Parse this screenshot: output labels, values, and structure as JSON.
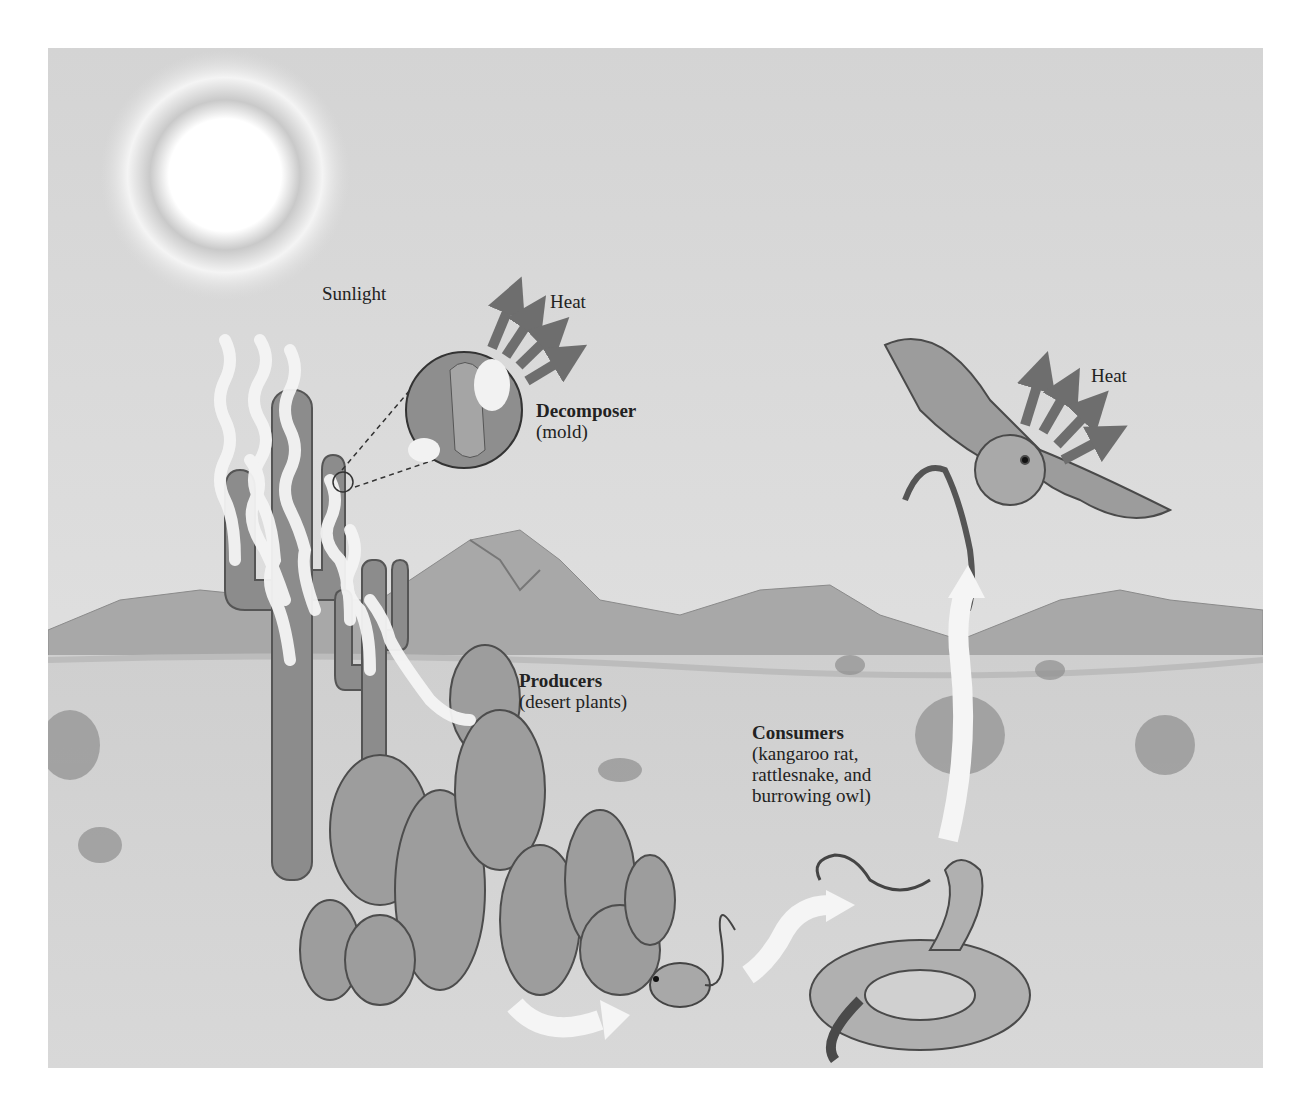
{
  "diagram": {
    "frame": {
      "x": 48,
      "y": 48,
      "width": 1215,
      "height": 1020,
      "background": "#d9d9d9"
    },
    "labels": {
      "sunlight": "Sunlight",
      "heat_decomposer": "Heat",
      "heat_owl": "Heat",
      "decomposer_title": "Decomposer",
      "decomposer_sub": "(mold)",
      "producers_title": "Producers",
      "producers_sub": "(desert plants)",
      "consumers_title": "Consumers",
      "consumers_sub_1": "(kangaroo rat,",
      "consumers_sub_2": "rattlesnake, and",
      "consumers_sub_3": "burrowing owl)"
    },
    "nodes": [
      {
        "id": "sun",
        "label": "Sunlight",
        "type": "energy-source"
      },
      {
        "id": "producers",
        "label": "Producers (desert plants)",
        "type": "producer"
      },
      {
        "id": "decomposer",
        "label": "Decomposer (mold)",
        "type": "decomposer"
      },
      {
        "id": "kangaroo-rat",
        "label": "kangaroo rat",
        "type": "consumer"
      },
      {
        "id": "rattlesnake",
        "label": "rattlesnake",
        "type": "consumer"
      },
      {
        "id": "burrowing-owl",
        "label": "burrowing owl",
        "type": "consumer"
      }
    ],
    "edges": [
      {
        "from": "sun",
        "to": "producers",
        "kind": "light-energy"
      },
      {
        "from": "producers",
        "to": "kangaroo-rat",
        "kind": "energy-transfer"
      },
      {
        "from": "kangaroo-rat",
        "to": "rattlesnake",
        "kind": "energy-transfer"
      },
      {
        "from": "rattlesnake",
        "to": "burrowing-owl",
        "kind": "energy-transfer"
      },
      {
        "from": "decomposer",
        "to": "environment",
        "kind": "heat-loss",
        "label": "Heat"
      },
      {
        "from": "burrowing-owl",
        "to": "environment",
        "kind": "heat-loss",
        "label": "Heat"
      }
    ],
    "colors": {
      "sky": "#dedede",
      "ground": "#d3d3d3",
      "mountains": "#a9a9a9",
      "heat_arrow": "#6e6e6e",
      "energy_arrow": "#f2f2f2",
      "text": "#222222"
    }
  }
}
